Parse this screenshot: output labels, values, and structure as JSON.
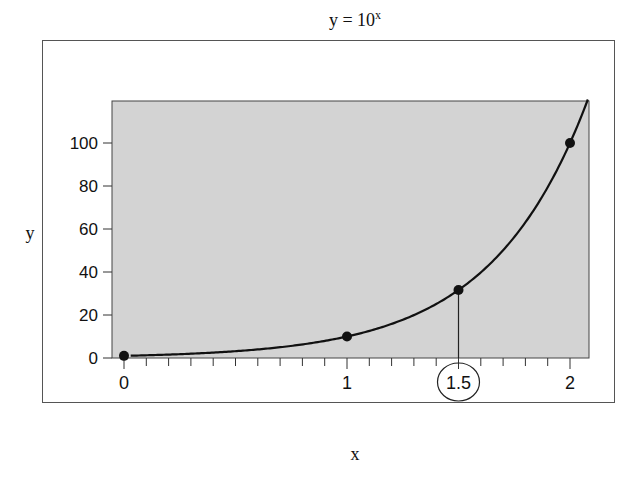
{
  "chart_data": {
    "type": "line",
    "title": "y = 10",
    "title_superscript": "x",
    "xlabel": "x",
    "ylabel": "y",
    "xlim": [
      -0.05,
      2.09
    ],
    "ylim": [
      0,
      119.5
    ],
    "x_ticks": [
      0,
      1,
      1.5,
      2
    ],
    "x_tick_labels": [
      "0",
      "1",
      "1.5",
      "2"
    ],
    "x_minor_tick_step": 0.1,
    "y_ticks": [
      0,
      20,
      40,
      60,
      80,
      100
    ],
    "y_tick_labels": [
      "0",
      "20",
      "40",
      "60",
      "80",
      "100"
    ],
    "grid": false,
    "plot_background": "#d3d3d3",
    "series": [
      {
        "name": "y = 10^x",
        "kind": "curve",
        "function": "10^x",
        "x_range": [
          0.03,
          2.08
        ],
        "color": "#111111"
      },
      {
        "name": "points",
        "kind": "scatter",
        "x": [
          0,
          1,
          1.5,
          2
        ],
        "y": [
          1,
          10,
          31.6,
          100
        ],
        "color": "#111111"
      }
    ],
    "annotations": [
      {
        "type": "drop-line",
        "x": 1.5,
        "y": 31.6,
        "to": "x-axis"
      },
      {
        "type": "circled-tick-label",
        "x": 1.5,
        "label": "1.5"
      }
    ]
  }
}
